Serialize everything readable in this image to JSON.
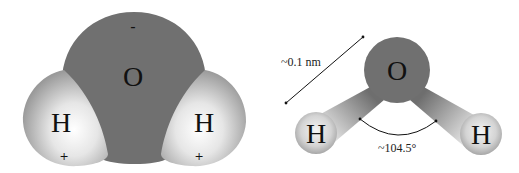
{
  "diagram": {
    "colors": {
      "oxygen": "#707070",
      "hydrogen_light": "#ffffff",
      "hydrogen_dark": "#8e8e8e",
      "text": "#111111",
      "background": "#ffffff"
    },
    "space_filling_model": {
      "oxygen": {
        "symbol": "O",
        "charge": "-"
      },
      "hydrogen_left": {
        "symbol": "H",
        "charge": "+"
      },
      "hydrogen_right": {
        "symbol": "H",
        "charge": "+"
      }
    },
    "ball_and_stick_model": {
      "oxygen": {
        "symbol": "O"
      },
      "hydrogen_left": {
        "symbol": "H"
      },
      "hydrogen_right": {
        "symbol": "H"
      },
      "bond_length_label": "~0.1 nm",
      "bond_angle_label": "~104.5°"
    }
  }
}
